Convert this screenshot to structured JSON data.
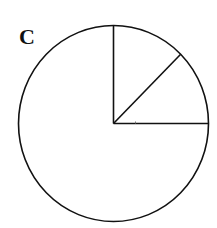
{
  "panel_label": "C",
  "chart_data": {
    "type": "pie",
    "title": "",
    "panel_label": "C",
    "start_angle_deg": 0,
    "direction": "counterclockwise",
    "slices": [
      {
        "label": "",
        "angle_deg": 45,
        "fraction": 0.125
      },
      {
        "label": "",
        "angle_deg": 45,
        "fraction": 0.125
      },
      {
        "label": "",
        "angle_deg": 270,
        "fraction": 0.75
      }
    ],
    "fill": "#ffffff",
    "stroke": "#111111",
    "legend": "none"
  }
}
